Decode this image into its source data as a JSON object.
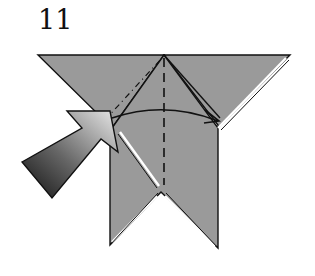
{
  "step": {
    "number": "11"
  },
  "diagram": {
    "paper_color": "#9a9a9a",
    "line_color": "#111111",
    "background": "#ffffff",
    "fold_lines": [
      {
        "type": "mountain-fold",
        "style": "dash-dot",
        "description": "diagonal from left edge to top apex"
      },
      {
        "type": "valley-fold",
        "style": "dashed",
        "description": "vertical center line"
      }
    ],
    "arrows": [
      {
        "type": "push-arrow",
        "description": "large gradient arrow pointing up-right into left side"
      },
      {
        "type": "fold-arrow",
        "description": "curved arrow from left to right across the top"
      }
    ]
  }
}
